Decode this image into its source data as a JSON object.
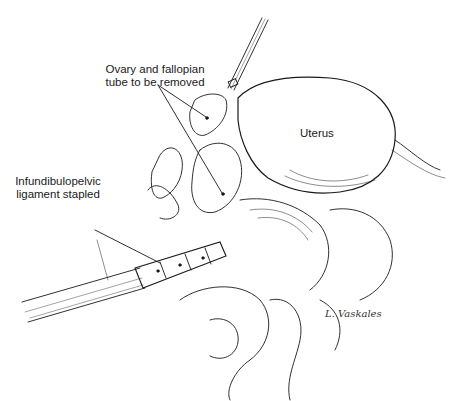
{
  "figure": {
    "type": "medical line illustration"
  },
  "labels": {
    "ovary": {
      "line1": "Ovary and fallopian",
      "line2": "tube to be removed"
    },
    "uterus": "Uterus",
    "ligament": {
      "line1": "Infundibulopelvic",
      "line2": "ligament stapled"
    }
  },
  "signature": "L. Vaskales",
  "colors": {
    "ink": "#1a1a1a",
    "background": "#ffffff"
  }
}
